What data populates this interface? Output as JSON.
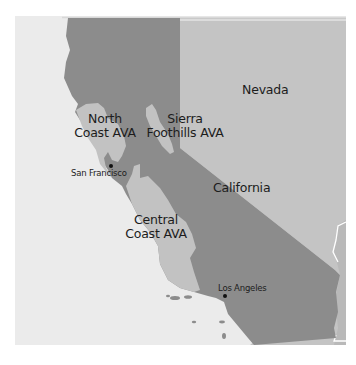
{
  "map": {
    "colors": {
      "ocean": "#ebebeb",
      "california": "#8c8c8c",
      "nevada": "#c4c4c4",
      "ava_region": "#c2c2c2",
      "border_line": "#ffffff",
      "label_text": "#1c1c1c",
      "city_marker": "#111111"
    },
    "regions": {
      "nevada": {
        "name": "Nevada"
      },
      "california": {
        "name": "California"
      },
      "north_coast_ava": {
        "line1": "North",
        "line2": "Coast AVA"
      },
      "sierra_foothills_ava": {
        "line1": "Sierra",
        "line2": "Foothills AVA"
      },
      "central_coast_ava": {
        "line1": "Central",
        "line2": "Coast AVA"
      }
    },
    "cities": {
      "san_francisco": {
        "name": "San Francisco",
        "icon": "city-dot-icon"
      },
      "los_angeles": {
        "name": "Los Angeles",
        "icon": "city-dot-icon"
      }
    }
  }
}
